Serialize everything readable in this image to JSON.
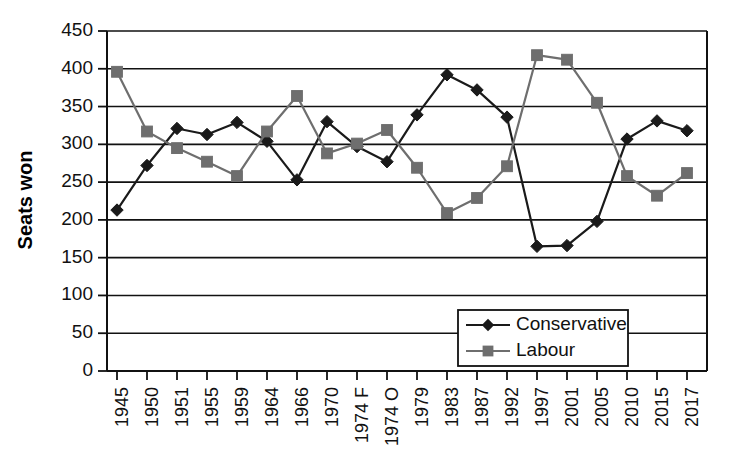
{
  "chart_data": {
    "type": "line",
    "title": "",
    "xlabel": "",
    "ylabel": "Seats won",
    "ylim": [
      0,
      450
    ],
    "ytick_step": 50,
    "yticks": [
      0,
      50,
      100,
      150,
      200,
      250,
      300,
      350,
      400,
      450
    ],
    "grid": true,
    "grid_axis": "y",
    "legend_position": "bottom-right",
    "categories": [
      "1945",
      "1950",
      "1951",
      "1955",
      "1959",
      "1964",
      "1966",
      "1970",
      "1974 F",
      "1974 O",
      "1979",
      "1983",
      "1987",
      "1992",
      "1997",
      "2001",
      "2005",
      "2010",
      "2015",
      "2017"
    ],
    "series": [
      {
        "name": "Conservative",
        "color": "#1a1a1a",
        "marker": "diamond",
        "values": [
          213,
          272,
          321,
          313,
          329,
          304,
          253,
          330,
          297,
          277,
          339,
          392,
          372,
          336,
          165,
          166,
          198,
          307,
          331,
          318
        ]
      },
      {
        "name": "Labour",
        "color": "#6e6e6e",
        "marker": "square",
        "values": [
          396,
          317,
          295,
          277,
          258,
          317,
          364,
          288,
          301,
          319,
          269,
          209,
          229,
          271,
          418,
          412,
          355,
          258,
          232,
          262
        ]
      }
    ]
  },
  "axes": {
    "y_axis_title": "Seats won",
    "y_tick_labels": [
      "450",
      "400",
      "350",
      "300",
      "250",
      "200",
      "150",
      "100",
      "50",
      "0"
    ],
    "x_tick_labels": [
      "1945",
      "1950",
      "1951",
      "1955",
      "1959",
      "1964",
      "1966",
      "1970",
      "1974 F",
      "1974 O",
      "1979",
      "1983",
      "1987",
      "1992",
      "1997",
      "2001",
      "2005",
      "2010",
      "2015",
      "2017"
    ]
  },
  "legend": {
    "entries": [
      {
        "label": "Conservative",
        "color": "#1a1a1a",
        "marker": "diamond"
      },
      {
        "label": "Labour",
        "color": "#6e6e6e",
        "marker": "square"
      }
    ]
  }
}
